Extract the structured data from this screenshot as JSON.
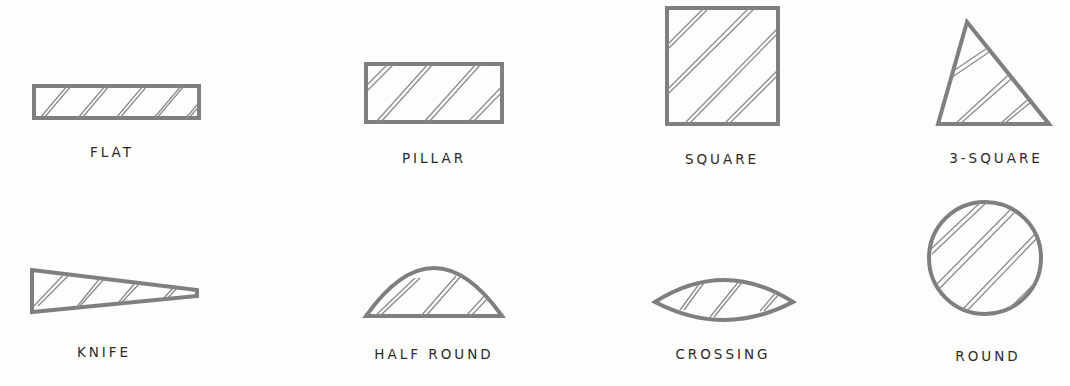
{
  "shapes": [
    {
      "id": "flat",
      "label": "FLAT"
    },
    {
      "id": "pillar",
      "label": "PILLAR"
    },
    {
      "id": "square",
      "label": "SQUARE"
    },
    {
      "id": "three-square",
      "label": "3-SQUARE"
    },
    {
      "id": "knife",
      "label": "KNIFE"
    },
    {
      "id": "half-round",
      "label": "HALF ROUND"
    },
    {
      "id": "crossing",
      "label": "CROSSING"
    },
    {
      "id": "round",
      "label": "ROUND"
    }
  ]
}
